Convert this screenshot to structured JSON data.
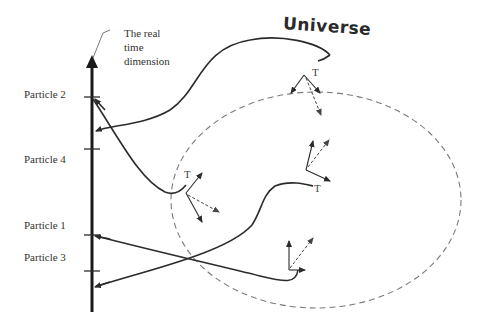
{
  "axis": {
    "title_lines": [
      "The real",
      "time",
      "dimension"
    ]
  },
  "particles": [
    {
      "label": "Particle 2",
      "y": 97
    },
    {
      "label": "Particle 4",
      "y": 158
    },
    {
      "label": "Particle 1",
      "y": 232
    },
    {
      "label": "Particle 3",
      "y": 264
    }
  ],
  "universe": {
    "label": "Universe"
  },
  "frames": [
    {
      "label": "T"
    },
    {
      "label": "T"
    },
    {
      "label": "T"
    }
  ],
  "colors": {
    "line": "#2b2b2b",
    "dashed": "#7a7a7a",
    "text": "#333333"
  }
}
